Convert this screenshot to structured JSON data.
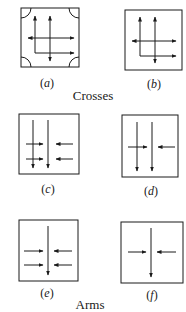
{
  "captions": {
    "crosses": "Crosses",
    "arms": "Arms"
  },
  "panels": [
    {
      "id": "a",
      "label": "a",
      "group": "Crosses",
      "corner_arcs": true,
      "vertical_arrows": 2,
      "horizontal_arrows": 2
    },
    {
      "id": "b",
      "label": "b",
      "group": "Crosses",
      "corner_arcs": false,
      "vertical_arrows": 2,
      "horizontal_arrows": 2
    },
    {
      "id": "c",
      "label": "c",
      "group": "Arms",
      "vertical_arrows": 2,
      "inward_arrow_rows": 2
    },
    {
      "id": "d",
      "label": "d",
      "group": "Arms",
      "vertical_arrows": 2,
      "inward_arrow_rows": 1
    },
    {
      "id": "e",
      "label": "e",
      "group": "Arms",
      "vertical_arrows": 1,
      "inward_arrow_rows": 2
    },
    {
      "id": "f",
      "label": "f",
      "group": "Arms",
      "vertical_arrows": 1,
      "inward_arrow_rows": 1
    }
  ],
  "colors": {
    "stroke": "#1a1a1a",
    "background": "#ffffff"
  }
}
